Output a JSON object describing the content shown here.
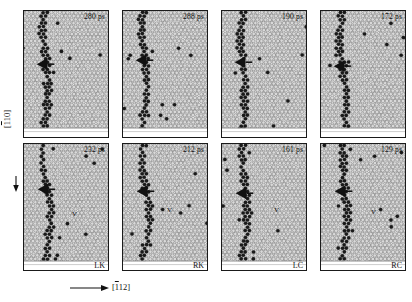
{
  "figure": {
    "background": "#ffffff",
    "atom_fill": "#d9d9d9",
    "atom_stroke": "#555555",
    "defect_fill": "#1a1a1a",
    "panel_border": "#1a1a1a"
  },
  "axes": {
    "vertical": {
      "label": "[110]",
      "overbar_on": "1",
      "arrow": "down-arrow-icon"
    },
    "horizontal": {
      "label": "[112]",
      "overbar_on": "1",
      "arrow": "right-arrow-icon"
    }
  },
  "panels": [
    {
      "id": "p1",
      "row": 0,
      "col": 0,
      "time": "280 ps",
      "caption": "",
      "marker": "arrowhead-left",
      "vacancy": ""
    },
    {
      "id": "p2",
      "row": 0,
      "col": 1,
      "time": "288 ps",
      "caption": "",
      "marker": "arrowhead-left",
      "vacancy": ""
    },
    {
      "id": "p3",
      "row": 0,
      "col": 2,
      "time": "190 ps",
      "caption": "",
      "marker": "arrowhead-left",
      "vacancy": ""
    },
    {
      "id": "p4",
      "row": 0,
      "col": 3,
      "time": "172 ps",
      "caption": "",
      "marker": "arrowhead-left",
      "vacancy": ""
    },
    {
      "id": "p5",
      "row": 1,
      "col": 0,
      "time": "232 ps",
      "caption": "LK",
      "marker": "arrowhead-left",
      "vacancy": "V"
    },
    {
      "id": "p6",
      "row": 1,
      "col": 1,
      "time": "212 ps",
      "caption": "RK",
      "marker": "arrowhead-left",
      "vacancy": "V"
    },
    {
      "id": "p7",
      "row": 1,
      "col": 2,
      "time": "161 ps",
      "caption": "LC",
      "marker": "arrowhead-left",
      "vacancy": "V"
    },
    {
      "id": "p8",
      "row": 1,
      "col": 3,
      "time": "129 ps",
      "caption": "RC",
      "marker": "arrowhead-left",
      "vacancy": "V"
    }
  ]
}
